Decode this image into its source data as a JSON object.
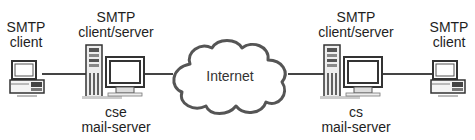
{
  "diagram": {
    "nodes": [
      {
        "id": "left-client",
        "type": "pc",
        "label_lines": [
          "SMTP",
          "client"
        ]
      },
      {
        "id": "left-server",
        "type": "server-workstation",
        "label_top_lines": [
          "SMTP",
          "client/server"
        ],
        "label_bottom_lines": [
          "cse",
          "mail-server"
        ]
      },
      {
        "id": "internet",
        "type": "cloud",
        "label": "Internet"
      },
      {
        "id": "right-server",
        "type": "server-workstation",
        "label_top_lines": [
          "SMTP",
          "client/server"
        ],
        "label_bottom_lines": [
          "cs",
          "mail-server"
        ]
      },
      {
        "id": "right-client",
        "type": "pc",
        "label_lines": [
          "SMTP",
          "client"
        ]
      }
    ],
    "edges": [
      {
        "from": "left-client",
        "to": "left-server"
      },
      {
        "from": "left-server",
        "to": "internet"
      },
      {
        "from": "internet",
        "to": "right-server"
      },
      {
        "from": "right-server",
        "to": "right-client"
      }
    ],
    "colors": {
      "line": "#444444",
      "cloud_stroke": "#555555",
      "device_stroke": "#333333",
      "screen": "#ffffff",
      "background": "#ffffff"
    }
  }
}
